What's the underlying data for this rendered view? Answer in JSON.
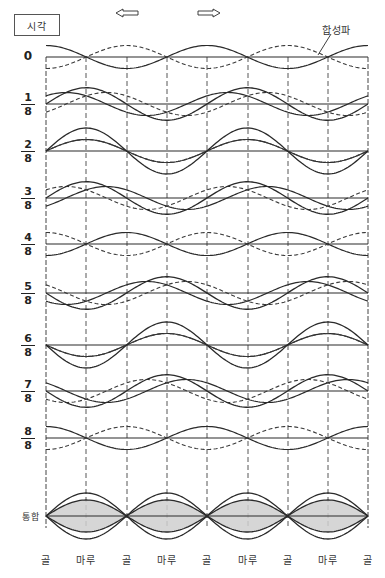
{
  "title": "시각",
  "composite_wave_label": "합성파",
  "direction_arrows": {
    "left": {
      "icon": "arrow-left-icon",
      "x": 128,
      "y": 13
    },
    "right": {
      "icon": "arrow-right-icon",
      "x": 208,
      "y": 13
    }
  },
  "rows": [
    {
      "num": "0",
      "den": "",
      "step": 0,
      "baseline_y": 57
    },
    {
      "num": "1",
      "den": "8",
      "step": 1,
      "baseline_y": 104
    },
    {
      "num": "2",
      "den": "8",
      "step": 2,
      "baseline_y": 151
    },
    {
      "num": "3",
      "den": "8",
      "step": 3,
      "baseline_y": 198
    },
    {
      "num": "4",
      "den": "8",
      "step": 4,
      "baseline_y": 244
    },
    {
      "num": "5",
      "den": "8",
      "step": 5,
      "baseline_y": 293
    },
    {
      "num": "6",
      "den": "8",
      "step": 6,
      "baseline_y": 345
    },
    {
      "num": "7",
      "den": "8",
      "step": 7,
      "baseline_y": 391
    },
    {
      "num": "8",
      "den": "8",
      "step": 8,
      "baseline_y": 438
    }
  ],
  "merge_row": {
    "label": "통합",
    "baseline_y": 516,
    "outer_amplitude": 23,
    "inner_amplitude": 16,
    "fill": "#cfcfcf"
  },
  "position_labels": [
    {
      "text": "골",
      "x": 46
    },
    {
      "text": "마루",
      "x": 86
    },
    {
      "text": "골",
      "x": 127
    },
    {
      "text": "마루",
      "x": 167
    },
    {
      "text": "골",
      "x": 207
    },
    {
      "text": "마루",
      "x": 248
    },
    {
      "text": "골",
      "x": 288
    },
    {
      "text": "마루",
      "x": 328
    },
    {
      "text": "골",
      "x": 368
    }
  ],
  "grid": {
    "x_left": 46,
    "x_right": 368,
    "y_top": 57,
    "y_bottom": 528,
    "vertical_lines_x": [
      46,
      86,
      127,
      167,
      207,
      248,
      288,
      328,
      368
    ],
    "wavelength_px": 161,
    "component_amplitude": 11.5,
    "steps_per_period": 8
  },
  "colors": {
    "line": "#2a2a2a",
    "dashed": "#3a3a3a",
    "grid": "#444444",
    "shade": "#cfcfcf"
  }
}
